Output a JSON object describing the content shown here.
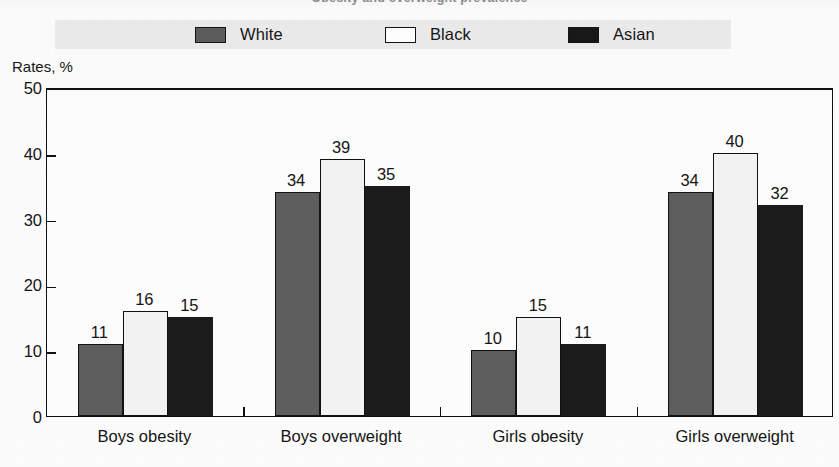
{
  "figure": {
    "clipped_title": "Obesity and overweight prevalence",
    "y_axis_caption": "Rates, %"
  },
  "legend": {
    "items": [
      {
        "label": "White",
        "swatch": "legend-swatch-white",
        "color": "#5d5d5d"
      },
      {
        "label": "Black",
        "swatch": "legend-swatch-black",
        "color": "#f2f2f2"
      },
      {
        "label": "Asian",
        "swatch": "legend-swatch-asian",
        "color": "#1b1b1b"
      }
    ]
  },
  "axis": {
    "y_ticks": [
      "0",
      "10",
      "20",
      "30",
      "40",
      "50"
    ]
  },
  "chart_data": {
    "type": "bar",
    "title": "Obesity and overweight prevalence",
    "xlabel": "",
    "ylabel": "Rates, %",
    "ylim": [
      0,
      50
    ],
    "yticks": [
      0,
      10,
      20,
      30,
      40,
      50
    ],
    "grid": false,
    "legend_position": "top",
    "categories": [
      "Boys obesity",
      "Boys overweight",
      "Girls obesity",
      "Girls overweight"
    ],
    "series": [
      {
        "name": "White",
        "color": "#5d5d5d",
        "values": [
          11,
          34,
          10,
          34
        ]
      },
      {
        "name": "Black",
        "color": "#f2f2f2",
        "values": [
          16,
          39,
          15,
          40
        ]
      },
      {
        "name": "Asian",
        "color": "#1b1b1b",
        "values": [
          15,
          35,
          11,
          32
        ]
      }
    ],
    "data_labels": [
      [
        "11",
        "16",
        "15"
      ],
      [
        "34",
        "39",
        "35"
      ],
      [
        "10",
        "15",
        "11"
      ],
      [
        "34",
        "40",
        "32"
      ]
    ]
  }
}
